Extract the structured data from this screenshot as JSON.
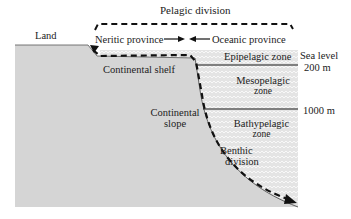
{
  "diagram": {
    "title": "Pelagic division",
    "labels": {
      "land": "Land",
      "neritic": "Neritic province",
      "oceanic": "Oceanic province",
      "pelagic": "Pelagic division",
      "sea_level": "Sea level",
      "depth_200": "200 m",
      "depth_1000": "1000 m",
      "epipelagic": "Epipelagic zone",
      "mesopelagic_1": "Mesopelagic",
      "mesopelagic_2": "zone",
      "bathypelagic_1": "Bathypelagic",
      "bathypelagic_2": "zone",
      "continental_shelf": "Continental shelf",
      "continental_slope_1": "Continental",
      "continental_slope_2": "slope",
      "benthic_1": "Benthic",
      "benthic_2": "division"
    },
    "colors": {
      "land": "#d6d6d6",
      "water": "#e6e6e6",
      "wave": "#f7f7f7",
      "line": "#1a1a1a"
    }
  }
}
